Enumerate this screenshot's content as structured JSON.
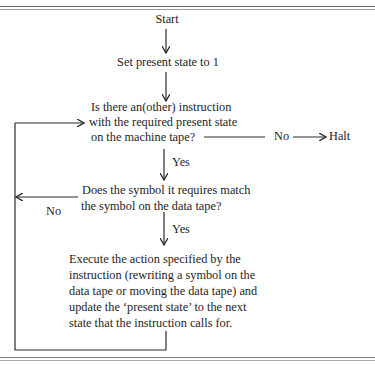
{
  "diagram": {
    "type": "flowchart",
    "nodes": {
      "start": {
        "label": "Start"
      },
      "init": {
        "label": "Set present state to 1"
      },
      "q1": {
        "lines": [
          "Is there an(other) instruction",
          "with the required present state",
          "on the machine tape?"
        ]
      },
      "halt": {
        "label": "Halt"
      },
      "q2": {
        "lines": [
          "Does the symbol it requires match",
          "the symbol on the data tape?"
        ]
      },
      "action": {
        "lines": [
          "Execute the action specified by the",
          "instruction (rewriting a symbol on the",
          "data tape or moving the data tape) and",
          "update the ‘present state’ to the next",
          "state that the instruction calls for."
        ]
      }
    },
    "edges": {
      "q1_no": "No",
      "q1_yes": "Yes",
      "q2_no": "No",
      "q2_yes": "Yes"
    },
    "edge_list": [
      {
        "from": "start",
        "to": "init",
        "label": ""
      },
      {
        "from": "init",
        "to": "q1",
        "label": ""
      },
      {
        "from": "q1",
        "to": "halt",
        "label": "No"
      },
      {
        "from": "q1",
        "to": "q2",
        "label": "Yes"
      },
      {
        "from": "q2",
        "to": "q1",
        "label": "No"
      },
      {
        "from": "q2",
        "to": "action",
        "label": "Yes"
      },
      {
        "from": "action",
        "to": "q1",
        "label": ""
      }
    ],
    "colors": {
      "line": "#2a2a2a",
      "text": "#1e1e1e",
      "background": "#ffffff"
    }
  }
}
